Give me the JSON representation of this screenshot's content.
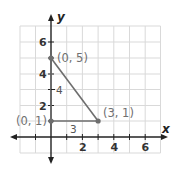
{
  "diagram": {
    "type": "coordinate-plane-triangle",
    "axes": {
      "x_label": "x",
      "y_label": "y"
    },
    "x_ticks": [
      {
        "value": 2,
        "label": "2"
      },
      {
        "value": 4,
        "label": "4"
      },
      {
        "value": 6,
        "label": "6"
      }
    ],
    "y_ticks": [
      {
        "value": 2,
        "label": "2"
      },
      {
        "value": 4,
        "label": "4"
      },
      {
        "value": 6,
        "label": "6"
      }
    ],
    "grid": {
      "x_range": [
        -2,
        7
      ],
      "y_range": [
        -1,
        7
      ]
    },
    "points": [
      {
        "x": 0,
        "y": 5,
        "label": "(0, 5)"
      },
      {
        "x": 3,
        "y": 1,
        "label": "(3, 1)"
      },
      {
        "x": 0,
        "y": 1,
        "label": "(0, 1)"
      }
    ],
    "segments": [
      {
        "from": [
          0,
          5
        ],
        "to": [
          0,
          1
        ],
        "length_label": "4"
      },
      {
        "from": [
          0,
          1
        ],
        "to": [
          3,
          1
        ],
        "length_label": "3"
      },
      {
        "from": [
          0,
          5
        ],
        "to": [
          3,
          1
        ],
        "length_label": ""
      }
    ],
    "colors": {
      "segment": "#6e6e6e",
      "grid": "#d9d9d9",
      "axis": "#222222",
      "point_label": "#707070"
    }
  }
}
